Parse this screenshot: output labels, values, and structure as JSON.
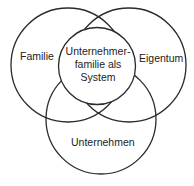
{
  "diagram": {
    "type": "venn",
    "circles": [
      {
        "id": "familie",
        "label": "Familie"
      },
      {
        "id": "eigentum",
        "label": "Eigentum"
      },
      {
        "id": "unternehmen",
        "label": "Unternehmen"
      }
    ],
    "center": {
      "lines": [
        "Unternehmer-",
        "familie als",
        "System"
      ]
    },
    "colors": {
      "stroke": "#2a2a2a",
      "text": "#222222",
      "background": "#ffffff"
    }
  }
}
